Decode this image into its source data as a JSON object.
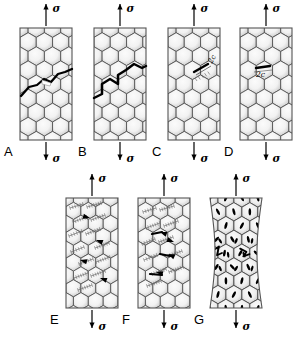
{
  "figure": {
    "background_color": "#ffffff",
    "width": 305,
    "height": 339,
    "stress_symbol": "σ",
    "crack_length_label": "2c",
    "cell_outline_color": "#4a4a4a",
    "cell_fill_light": "#f2f2f2",
    "cell_fill_dark": "#c4c4c4",
    "crack_color": "#000000",
    "specimen_border_color": "#555555",
    "slip_band_color": "#6b6b6b",
    "void_color": "#000000"
  },
  "panels": [
    {
      "id": "A",
      "label": "A",
      "row": 1,
      "column": 1,
      "top_arrow_label": "σ",
      "bottom_arrow_label": "σ",
      "damage_mode": "irregular transgranular crack crossing cell walls",
      "crack_type": "irregular",
      "has_dimension_label": false,
      "dimension_label": "",
      "x": 20,
      "y": 28,
      "w": 52,
      "h": 112
    },
    {
      "id": "B",
      "label": "B",
      "row": 1,
      "column": 2,
      "top_arrow_label": "σ",
      "bottom_arrow_label": "σ",
      "damage_mode": "zigzag crack following cell walls",
      "crack_type": "zigzag",
      "has_dimension_label": false,
      "dimension_label": "",
      "x": 94,
      "y": 28,
      "w": 52,
      "h": 112
    },
    {
      "id": "C",
      "label": "C",
      "row": 1,
      "column": 3,
      "top_arrow_label": "σ",
      "bottom_arrow_label": "σ",
      "damage_mode": "inclined short crack of length 2c",
      "crack_type": "inclined-short",
      "has_dimension_label": true,
      "dimension_label": "2c",
      "x": 168,
      "y": 28,
      "w": 52,
      "h": 112
    },
    {
      "id": "D",
      "label": "D",
      "row": 1,
      "column": 4,
      "top_arrow_label": "σ",
      "bottom_arrow_label": "σ",
      "damage_mode": "horizontal short crack of length 2c",
      "crack_type": "horizontal-short",
      "has_dimension_label": true,
      "dimension_label": "2c",
      "x": 240,
      "y": 28,
      "w": 52,
      "h": 112
    },
    {
      "id": "E",
      "label": "E",
      "row": 2,
      "column": 1,
      "top_arrow_label": "σ",
      "bottom_arrow_label": "σ",
      "damage_mode": "distributed slip bands with microcracks",
      "crack_type": "slip-bands",
      "has_dimension_label": false,
      "dimension_label": "",
      "x": 66,
      "y": 198,
      "w": 52,
      "h": 110
    },
    {
      "id": "F",
      "label": "F",
      "row": 2,
      "column": 2,
      "top_arrow_label": "σ",
      "bottom_arrow_label": "σ",
      "damage_mode": "slip bands localizing into a crack path",
      "crack_type": "slip-bands-localized",
      "has_dimension_label": false,
      "dimension_label": "",
      "x": 138,
      "y": 198,
      "w": 52,
      "h": 110
    },
    {
      "id": "G",
      "label": "G",
      "row": 2,
      "column": 3,
      "top_arrow_label": "σ",
      "bottom_arrow_label": "σ",
      "damage_mode": "necking with void nucleation and coalescence",
      "crack_type": "voids-necking",
      "has_dimension_label": false,
      "dimension_label": "",
      "x": 210,
      "y": 198,
      "w": 52,
      "h": 110
    }
  ]
}
